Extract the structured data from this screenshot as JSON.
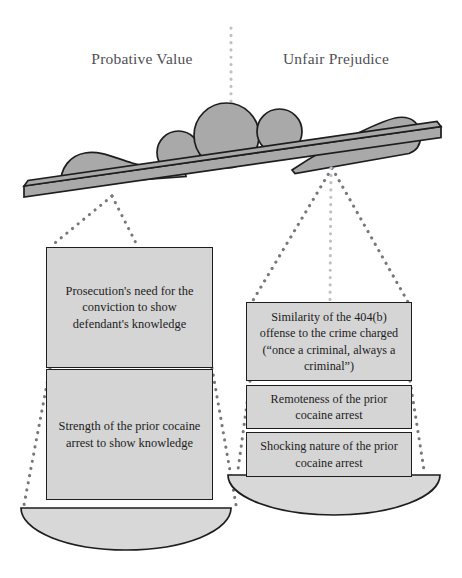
{
  "diagram": {
    "title_left": "Probative Value",
    "title_right": "Unfair Prejudice",
    "colors": {
      "weight_fill": "#a9a9a9",
      "weight_stroke": "#1d1d1d",
      "beam_fill": "#a9a9a9",
      "beam_stroke": "#1d1d1d",
      "box_fill": "#d5d5d5",
      "box_stroke": "#1d1d1d",
      "pan_fill": "#d8d8d8",
      "pan_stroke": "#1d1d1d",
      "cord_dot": "#77777d",
      "cord_dot_light": "#bfbfc4",
      "heading_text": "#4f4f55",
      "body_text": "#1c1c1c",
      "background": "#ffffff"
    }
  },
  "left_pan": {
    "factors": [
      {
        "text": "Prosecution's need for the conviction to show defendant's knowledge"
      },
      {
        "text": "Strength of the prior cocaine arrest to show knowledge"
      }
    ]
  },
  "right_pan": {
    "factors": [
      {
        "text": "Similarity of the 404(b) offense to the crime charged (“once a criminal, always a criminal”)"
      },
      {
        "text": "Remoteness of the prior cocaine arrest"
      },
      {
        "text": "Shocking nature of the prior cocaine arrest"
      }
    ]
  }
}
